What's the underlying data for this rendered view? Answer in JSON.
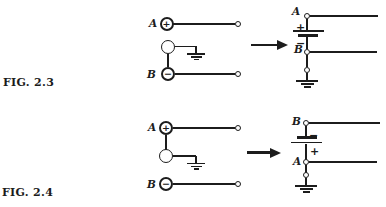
{
  "ink_color": "#1c1c1c",
  "background_color": "#ffffff",
  "figures": [
    {
      "label": "FIG. 2.3",
      "left_circuit": {
        "terminal_a_label": "A",
        "terminal_a_sign": "+",
        "terminal_b_label": "B",
        "terminal_b_sign": "−"
      },
      "right_circuit": {
        "node_a_label": "A",
        "battery_plus_sign": "+",
        "battery_minus_sign": "−",
        "node_b_label": "B"
      }
    },
    {
      "label": "FIG. 2.4",
      "left_circuit": {
        "terminal_a_label": "A",
        "terminal_a_sign": "+",
        "terminal_b_label": "B",
        "terminal_b_sign": "−"
      },
      "right_circuit": {
        "node_b_label": "B",
        "battery_minus_sign": "−",
        "battery_plus_sign": "+",
        "node_a_label": "A"
      }
    }
  ]
}
